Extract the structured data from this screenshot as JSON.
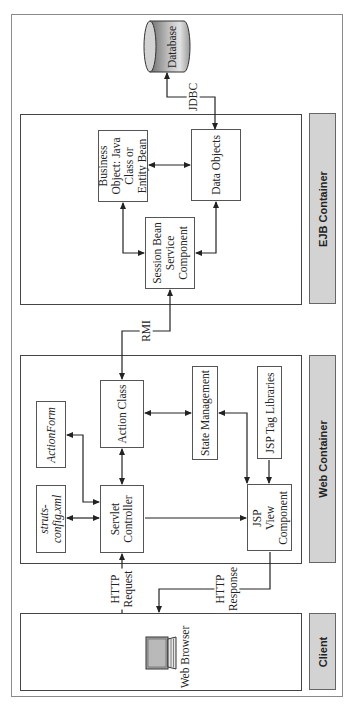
{
  "diagram": {
    "orientation": "rotated -90deg (landscape diagram shown in portrait)",
    "tiers": [
      {
        "id": "ejb",
        "label": "EJB Container"
      },
      {
        "id": "web",
        "label": "Web Container"
      },
      {
        "id": "client",
        "label": "Client"
      }
    ],
    "nodes": {
      "database": "Database",
      "business_object": [
        "Business",
        "Object: Java",
        "Class or",
        "Entity Bean"
      ],
      "data_objects": "Data Objects",
      "session_bean": [
        "Session Bean",
        "Service",
        "Component"
      ],
      "action_form": "ActionForm",
      "struts_config": [
        "struts-",
        "config.xml"
      ],
      "action_class": "Action Class",
      "servlet_controller": [
        "Servlet",
        "Controller"
      ],
      "state_management": "State Management",
      "jsp_tag_libraries": "JSP Tag Libraries",
      "jsp_view": [
        "JSP",
        "View",
        "Component"
      ],
      "web_browser": "Web Browser"
    },
    "edges": {
      "jdbc": "JDBC",
      "rmi": "RMI",
      "http_request": [
        "HTTP",
        "Request"
      ],
      "http_response": [
        "HTTP",
        "Response"
      ]
    },
    "colors": {
      "label_bar": "#d3d3d3",
      "border": "#555555",
      "database_dark": "#7a7a7a",
      "database_light": "#d8d8d8"
    }
  }
}
